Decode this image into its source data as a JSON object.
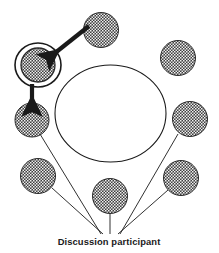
{
  "figure": {
    "background_color": "#ffffff",
    "ink_color": "#1a1a1a",
    "participant_fill_color": "#4a4a4a",
    "participant_texture": "dotted-checker",
    "caption": {
      "label": "Discussion participant",
      "x": 109,
      "y": 245
    },
    "table": {
      "name": "discussion-table",
      "shape": "ellipse",
      "cx": 110.5,
      "cy": 113.5,
      "rx": 55.5,
      "ry": 48.5,
      "fill": "none",
      "stroke": "#1a1a1a"
    },
    "participants": [
      {
        "id": "participant-top",
        "cx": 101,
        "cy": 30,
        "r": 17.5,
        "highlighted": false,
        "label_line": false
      },
      {
        "id": "participant-top-right",
        "cx": 178,
        "cy": 58,
        "r": 17.5,
        "highlighted": false,
        "label_line": false
      },
      {
        "id": "participant-highlighted",
        "cx": 38,
        "cy": 65,
        "r": 17.0,
        "highlighted": true,
        "label_line": false
      },
      {
        "id": "participant-right",
        "cx": 190,
        "cy": 119,
        "r": 17.5,
        "highlighted": false,
        "label_line": true
      },
      {
        "id": "participant-left",
        "cx": 32,
        "cy": 120,
        "r": 17.0,
        "highlighted": false,
        "label_line": true
      },
      {
        "id": "participant-lower-left",
        "cx": 38,
        "cy": 176,
        "r": 17.5,
        "highlighted": false,
        "label_line": true
      },
      {
        "id": "participant-lower-right",
        "cx": 181,
        "cy": 178,
        "r": 17.5,
        "highlighted": false,
        "label_line": true
      },
      {
        "id": "participant-bottom",
        "cx": 110,
        "cy": 196,
        "r": 17.5,
        "highlighted": false,
        "label_line": true
      }
    ],
    "leader_lines": [
      {
        "id": "leader-line-left",
        "x1": 40,
        "y1": 134,
        "x2": 101,
        "y2": 234
      },
      {
        "id": "leader-line-lower-left",
        "x1": 52,
        "y1": 188,
        "x2": 103,
        "y2": 234
      },
      {
        "id": "leader-line-bottom",
        "x1": 110,
        "y1": 212,
        "x2": 110,
        "y2": 234
      },
      {
        "id": "leader-line-lower-right",
        "x1": 168,
        "y1": 190,
        "x2": 118,
        "y2": 234
      },
      {
        "id": "leader-line-right",
        "x1": 178,
        "y1": 134,
        "x2": 120,
        "y2": 234
      }
    ],
    "arrows": [
      {
        "id": "pointer-arrow-diagonal",
        "direction": "down-left",
        "x1": 89,
        "y1": 26,
        "x2": 55,
        "y2": 53,
        "width": 4.2,
        "points_to": "participant-highlighted"
      },
      {
        "id": "pointer-arrow-vertical",
        "direction": "down",
        "x1": 32,
        "y1": 84,
        "x2": 32,
        "y2": 101,
        "width": 4.2,
        "points_to": "participant-left"
      }
    ],
    "highlight_ring": {
      "id": "highlight-ring",
      "cx": 38,
      "cy": 65,
      "rx": 23,
      "ry": 22,
      "stroke": "#1a1a1a"
    }
  }
}
